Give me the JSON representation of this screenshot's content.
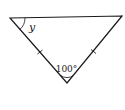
{
  "diagram": {
    "type": "isosceles-triangle",
    "vertices": {
      "top_left": [
        10,
        18
      ],
      "top_right": [
        122,
        16
      ],
      "bottom": [
        67,
        83
      ]
    },
    "angle_labels": {
      "top_left": "y",
      "bottom": "100°"
    },
    "equal_side_marks": [
      "left-side",
      "right-side"
    ],
    "colors": {
      "stroke": "#1a1a1a",
      "background": "#ffffff"
    }
  }
}
